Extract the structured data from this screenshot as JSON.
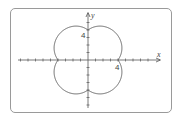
{
  "graph": {
    "type": "polar-curve",
    "equation_estimate": "r = 4 + 2|sin 2θ| (approximate, inferred from shape)",
    "axes": {
      "x_label": "x",
      "y_label": "y",
      "x_tick_label": "4",
      "y_tick_label": "4",
      "tick_step": 1,
      "x_range": [
        -9,
        9
      ],
      "y_range": [
        -7,
        7
      ]
    },
    "curve_color": "#555555",
    "axis_color": "#555555",
    "frame_color": "#9a9a9a"
  }
}
